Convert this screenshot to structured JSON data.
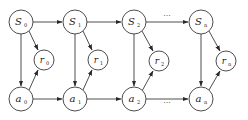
{
  "diagram": {
    "type": "markov-decision-process-chain",
    "columns": [
      {
        "state": {
          "base": "S",
          "sub": "0"
        },
        "reward": {
          "base": "r",
          "sub": "0"
        },
        "action": {
          "base": "a",
          "sub": "0"
        }
      },
      {
        "state": {
          "base": "S",
          "sub": "1"
        },
        "reward": {
          "base": "r",
          "sub": "1"
        },
        "action": {
          "base": "a",
          "sub": "1"
        }
      },
      {
        "state": {
          "base": "S",
          "sub": "2"
        },
        "reward": {
          "base": "r",
          "sub": "2"
        },
        "action": {
          "base": "a",
          "sub": "2"
        }
      },
      {
        "state": {
          "base": "S",
          "sub": "n"
        },
        "reward": {
          "base": "r",
          "sub": "n"
        },
        "action": {
          "base": "a",
          "sub": "n"
        }
      }
    ],
    "ellipsis_label": "···",
    "edges": [
      "S0->S1",
      "S1->S2",
      "S2->Sn (···)",
      "a0->a1",
      "a1->a2",
      "a2->an (···)",
      "S0->a0",
      "S1->a1",
      "S2->a2",
      "Sn->an",
      "S0->r0",
      "S1->r1",
      "S2->r2",
      "Sn->rn",
      "a0->r0",
      "a1->r1",
      "a2->r2",
      "an->rn",
      "a0->S1",
      "a1->S2"
    ],
    "colors": {
      "stroke": "#3a3a3a",
      "fill": "#ffffff",
      "text": "#222222"
    }
  }
}
